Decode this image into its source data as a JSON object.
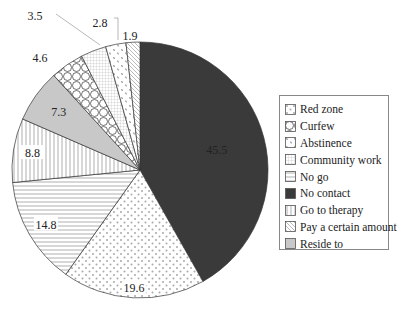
{
  "chart_data": {
    "type": "pie",
    "title": "",
    "start_angle": "12 o'clock",
    "direction": "clockwise",
    "slices": [
      {
        "label": "No contact",
        "value": 45.5,
        "pattern": "solid-dark",
        "color": "#3a3a3a"
      },
      {
        "label": "Red zone",
        "value": 19.6,
        "pattern": "dots",
        "color": "#ffffff"
      },
      {
        "label": "No go",
        "value": 14.8,
        "pattern": "horizontal-lines",
        "color": "#ffffff"
      },
      {
        "label": "Go to therapy",
        "value": 8.8,
        "pattern": "vertical-lines",
        "color": "#ffffff"
      },
      {
        "label": "Reside to",
        "value": 7.3,
        "pattern": "solid-gray",
        "color": "#c8c8c8"
      },
      {
        "label": "Curfew",
        "value": 4.6,
        "pattern": "circles",
        "color": "#ffffff"
      },
      {
        "label": "Community work",
        "value": 3.5,
        "pattern": "grid",
        "color": "#ffffff"
      },
      {
        "label": "Abstinence",
        "value": 2.8,
        "pattern": "speckle",
        "color": "#ffffff"
      },
      {
        "label": "Pay a certain amount",
        "value": 1.9,
        "pattern": "diagonal-lines",
        "color": "#ffffff"
      }
    ],
    "legend_position": "right"
  },
  "legend": {
    "items": [
      {
        "label": "Red zone",
        "pattern": "dots"
      },
      {
        "label": "Curfew",
        "pattern": "circles"
      },
      {
        "label": "Abstinence",
        "pattern": "speckle"
      },
      {
        "label": "Community work",
        "pattern": "grid"
      },
      {
        "label": "No go",
        "pattern": "horizontal-lines"
      },
      {
        "label": "No contact",
        "pattern": "solid-dark"
      },
      {
        "label": "Go to therapy",
        "pattern": "vertical-lines"
      },
      {
        "label": "Pay a certain amount",
        "pattern": "diagonal-lines"
      },
      {
        "label": "Reside to",
        "pattern": "solid-gray"
      }
    ]
  }
}
